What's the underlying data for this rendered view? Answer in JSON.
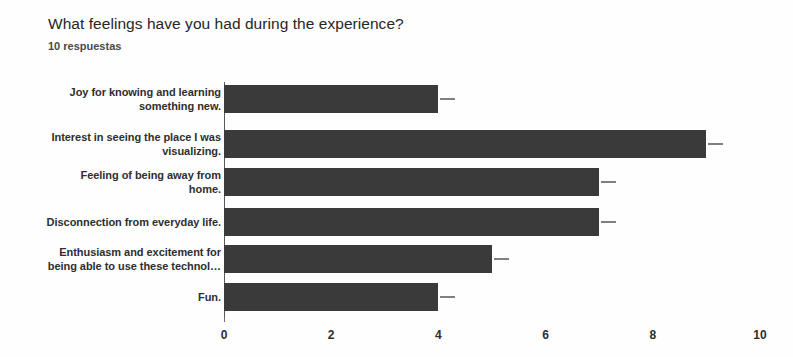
{
  "header": {
    "title": "What feelings have you had during the experience?",
    "subtitle": "10 respuestas"
  },
  "colors": {
    "bar": "#3a3a3a",
    "axis": "#55595c",
    "tick_mark": "#7d8184",
    "title_text": "#262626",
    "label_text": "#2e2e2e",
    "background": "#fefefe"
  },
  "chart_data": {
    "type": "bar",
    "orientation": "horizontal",
    "title": "What feelings have you had during the experience?",
    "subtitle": "10 respuestas",
    "xlabel": "",
    "ylabel": "",
    "xlim": [
      0,
      10
    ],
    "xticks": [
      0,
      2,
      4,
      6,
      8,
      10
    ],
    "xtick_labels": [
      "0",
      "2",
      "4",
      "6",
      "8",
      "10"
    ],
    "grid": false,
    "legend": false,
    "response_count": 10,
    "categories": [
      "Joy for knowing and learning something new.",
      "Interest in seeing the place I was visualizing.",
      "Feeling of being away from home.",
      "Disconnection from everyday life.",
      "Enthusiasm and excitement for being able to use these technol…",
      "Fun."
    ],
    "category_lines": [
      [
        "Joy for knowing and learning",
        "something new."
      ],
      [
        "Interest in seeing the place I was",
        "visualizing."
      ],
      [
        "Feeling of being away from",
        "home."
      ],
      [
        "Disconnection from everyday life."
      ],
      [
        "Enthusiasm and excitement for",
        "being able to use these technol…"
      ],
      [
        "Fun."
      ]
    ],
    "values": [
      4,
      9,
      7,
      7,
      5,
      4
    ],
    "series": [
      {
        "name": "respuestas",
        "values": [
          4,
          9,
          7,
          7,
          5,
          4
        ]
      }
    ]
  }
}
